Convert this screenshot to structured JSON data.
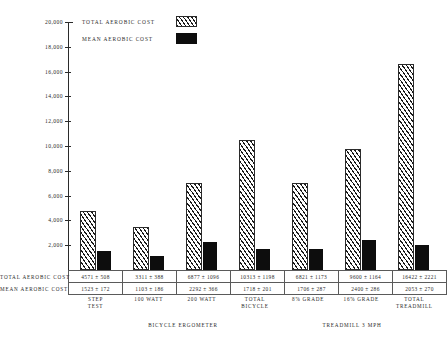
{
  "chart_data": {
    "type": "bar",
    "title": "",
    "xlabel": "",
    "ylabel": "",
    "ylim": [
      0,
      20000
    ],
    "grid": false,
    "legend_position": "top-left",
    "categories": [
      "STEP\nTEST",
      "100 WATT",
      "200 WATT",
      "TOTAL\nBICYCLE",
      "8% GRADE",
      "16% GRADE",
      "TOTAL\nTREADMILL"
    ],
    "group_labels": [
      "BICYCLE ERGOMETER",
      "TREADMILL 3 MPH"
    ],
    "series": [
      {
        "name": "TOTAL AEROBIC COST",
        "pattern": "hatched",
        "values": [
          4571,
          3311,
          6877,
          10313,
          6821,
          9600,
          16422
        ],
        "errors": [
          508,
          388,
          1096,
          1198,
          1173,
          1164,
          2221
        ],
        "labels": [
          "4571 ± 508",
          "3311 ± 388",
          "6877 ± 1096",
          "10313 ± 1198",
          "6821 ± 1173",
          "9600 ± 1164",
          "16422 ± 2221"
        ]
      },
      {
        "name": "MEAN AEROBIC COST",
        "pattern": "solid",
        "values": [
          1523,
          1103,
          2292,
          1718,
          1706,
          2400,
          2053
        ],
        "errors": [
          172,
          186,
          366,
          201,
          287,
          286,
          270
        ],
        "labels": [
          "1523 ± 172",
          "1103 ± 186",
          "2292 ± 366",
          "1718 ± 201",
          "1706 ± 287",
          "2400 ± 286",
          "2053 ± 270"
        ]
      }
    ],
    "yticks": [
      2000,
      4000,
      6000,
      8000,
      10000,
      12000,
      14000,
      16000,
      18000,
      20000
    ],
    "ytick_labels": [
      "2,000",
      "4,000",
      "6,000",
      "8,000",
      "10,000",
      "12,000",
      "14,000",
      "16,000",
      "18,000",
      "20,000"
    ]
  },
  "legend": {
    "items": [
      {
        "label": "TOTAL AEROBIC COST",
        "style": "hatched"
      },
      {
        "label": "MEAN AEROBIC COST",
        "style": "solid"
      }
    ]
  },
  "table": {
    "row_labels": [
      "TOTAL AEROBIC COST",
      "MEAN AEROBIC COST"
    ]
  },
  "colors": {
    "ink": "#1a1a1a",
    "axis": "#2b2b2b",
    "bar_solid": "#0d0d0d",
    "background": "#ffffff",
    "table_border": "#5a5a5a"
  }
}
